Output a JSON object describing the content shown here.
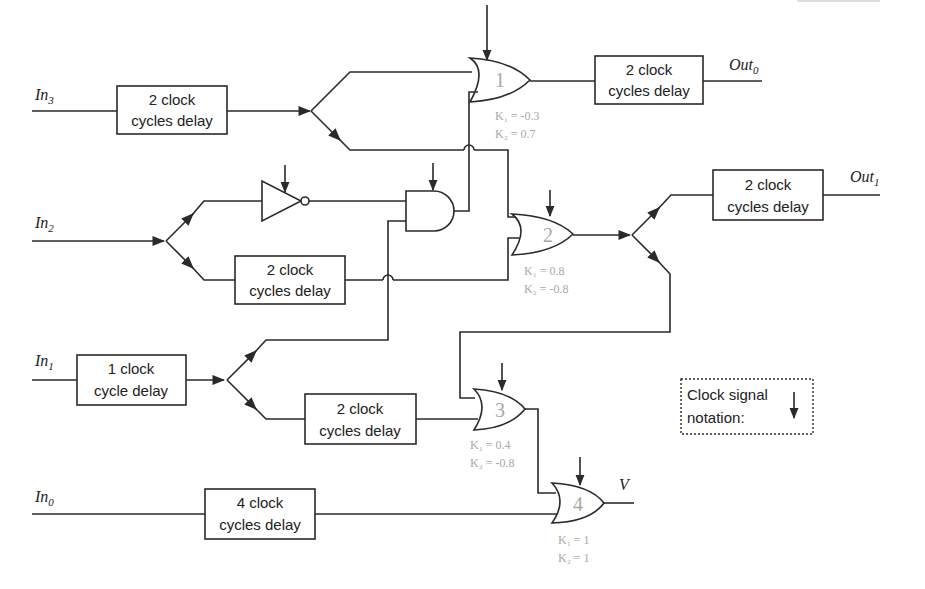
{
  "inputs": [
    {
      "id": "in3",
      "base": "In",
      "sub": "3"
    },
    {
      "id": "in2",
      "base": "In",
      "sub": "2"
    },
    {
      "id": "in1",
      "base": "In",
      "sub": "1"
    },
    {
      "id": "in0",
      "base": "In",
      "sub": "0"
    }
  ],
  "outputs": [
    {
      "id": "out0",
      "base": "Out",
      "sub": "0"
    },
    {
      "id": "out1",
      "base": "Out",
      "sub": "1"
    },
    {
      "id": "v",
      "base": "V",
      "sub": ""
    }
  ],
  "delay_boxes": [
    {
      "id": "d_in3",
      "line1": "2 clock",
      "line2": "cycles delay"
    },
    {
      "id": "d_out0",
      "line1": "2 clock",
      "line2": "cycles delay"
    },
    {
      "id": "d_in2",
      "line1": "2 clock",
      "line2": "cycles delay"
    },
    {
      "id": "d_out1",
      "line1": "2 clock",
      "line2": "cycles delay"
    },
    {
      "id": "d_in1",
      "line1": "1 clock",
      "line2": "cycle delay"
    },
    {
      "id": "d_in1b",
      "line1": "2 clock",
      "line2": "cycles delay"
    },
    {
      "id": "d_in0",
      "line1": "4 clock",
      "line2": "cycles delay"
    }
  ],
  "gates": [
    {
      "id": "g1",
      "type": "OR",
      "number": "1",
      "k1": "K₁ = -0.3",
      "k2": "K₂ = 0.7"
    },
    {
      "id": "g2",
      "type": "OR",
      "number": "2",
      "k1": "K₁ = 0.8",
      "k2": "K₂ = -0.8"
    },
    {
      "id": "g3",
      "type": "OR",
      "number": "3",
      "k1": "K₁ = 0.4",
      "k2": "K₂ = -0.8"
    },
    {
      "id": "g4",
      "type": "OR",
      "number": "4",
      "k1": "K₁ = 1",
      "k2": "K₂ = 1"
    },
    {
      "id": "gand",
      "type": "AND"
    },
    {
      "id": "gnot",
      "type": "NOT"
    }
  ],
  "legend": {
    "line1": "Clock signal",
    "line2": "notation:",
    "icon": "down-arrow-icon"
  },
  "colors": {
    "line": "#2a2a2a",
    "gate_param_text": "#a8a8a8",
    "background": "#ffffff"
  }
}
